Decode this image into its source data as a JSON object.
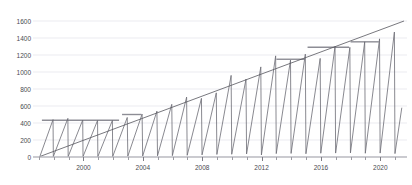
{
  "chart_data": {
    "type": "line",
    "title": "",
    "xlabel": "",
    "ylabel": "",
    "xlim": [
      1996.6,
      2021.8
    ],
    "ylim": [
      0,
      1600
    ],
    "grid": true,
    "grid_axis": "y",
    "legend": "none",
    "y_ticks": [
      0,
      200,
      400,
      600,
      800,
      1000,
      1200,
      1400,
      1600
    ],
    "y_tick_labels": [
      "0",
      "200",
      "400",
      "600",
      "800",
      "1000",
      "1200",
      "1400",
      "1600"
    ],
    "x_ticks": [
      1997,
      1998,
      1999,
      2000,
      2001,
      2002,
      2003,
      2004,
      2005,
      2006,
      2007,
      2008,
      2009,
      2010,
      2011,
      2012,
      2013,
      2014,
      2015,
      2016,
      2017,
      2018,
      2019,
      2020,
      2021
    ],
    "x_tick_labels": [
      {
        "x": 2000,
        "label": "2000"
      },
      {
        "x": 2004,
        "label": "2004"
      },
      {
        "x": 2008,
        "label": "2008"
      },
      {
        "x": 2012,
        "label": "2012"
      },
      {
        "x": 2016,
        "label": "2016"
      },
      {
        "x": 2020,
        "label": "2020"
      }
    ],
    "series": [
      {
        "name": "sawtooth",
        "type": "line",
        "color": "#6b6b73",
        "width": 0.8,
        "description": "cumulative accrual that resets to zero each cycle",
        "points": [
          [
            1997.05,
            0
          ],
          [
            1997.95,
            440
          ],
          [
            1997.97,
            5
          ],
          [
            1998.95,
            455
          ],
          [
            1998.97,
            5
          ],
          [
            1999.95,
            435
          ],
          [
            1999.97,
            5
          ],
          [
            2000.95,
            430
          ],
          [
            2000.97,
            5
          ],
          [
            2001.95,
            430
          ],
          [
            2001.97,
            5
          ],
          [
            2002.95,
            465
          ],
          [
            2002.99,
            10
          ],
          [
            2003.95,
            505
          ],
          [
            2003.99,
            12
          ],
          [
            2004.95,
            540
          ],
          [
            2004.99,
            14
          ],
          [
            2005.95,
            620
          ],
          [
            2005.99,
            16
          ],
          [
            2006.95,
            705
          ],
          [
            2006.99,
            20
          ],
          [
            2007.95,
            690
          ],
          [
            2007.99,
            25
          ],
          [
            2008.95,
            755
          ],
          [
            2008.99,
            30
          ],
          [
            2009.95,
            960
          ],
          [
            2009.99,
            32
          ],
          [
            2010.95,
            915
          ],
          [
            2010.99,
            36
          ],
          [
            2011.95,
            1060
          ],
          [
            2011.99,
            24
          ],
          [
            2012.95,
            1190
          ],
          [
            2012.99,
            40
          ],
          [
            2013.95,
            1140
          ],
          [
            2013.99,
            42
          ],
          [
            2014.95,
            1210
          ],
          [
            2014.99,
            38
          ],
          [
            2015.95,
            1160
          ],
          [
            2015.99,
            44
          ],
          [
            2016.95,
            1300
          ],
          [
            2016.99,
            46
          ],
          [
            2017.95,
            1290
          ],
          [
            2017.99,
            48
          ],
          [
            2018.95,
            1355
          ],
          [
            2018.99,
            44
          ],
          [
            2019.95,
            1390
          ],
          [
            2019.99,
            46
          ],
          [
            2020.95,
            1470
          ],
          [
            2020.99,
            40
          ],
          [
            2021.45,
            580
          ]
        ]
      },
      {
        "name": "trend-envelope",
        "type": "line",
        "color": "#55555d",
        "width": 0.8,
        "description": "rising upper envelope trend line across peaks",
        "points": [
          [
            1997.1,
            8
          ],
          [
            2021.6,
            1600
          ]
        ]
      },
      {
        "name": "cap-levels",
        "type": "step",
        "color": "#8d8d95",
        "width": 1.4,
        "description": "horizontal plateau/cap segments",
        "segments": [
          {
            "x0": 1997.2,
            "x1": 2002.4,
            "y": 432
          },
          {
            "x0": 2002.6,
            "x1": 2003.9,
            "y": 500
          },
          {
            "x0": 2013.0,
            "x1": 2014.9,
            "y": 1150
          },
          {
            "x0": 2015.1,
            "x1": 2017.9,
            "y": 1292
          },
          {
            "x0": 2018.0,
            "x1": 2019.9,
            "y": 1355
          }
        ]
      }
    ]
  },
  "colors": {
    "background": "#ffffff",
    "grid": "#e3e3ea",
    "axis": "#9b9ba2",
    "baseline": "#b9b9c0",
    "text": "#4a4a50",
    "sawtooth": "#6b6b73",
    "trend": "#55555d",
    "cap": "#8d8d95"
  }
}
